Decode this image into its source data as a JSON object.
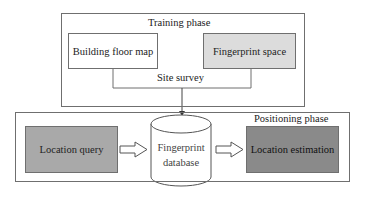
{
  "diagram": {
    "training_phase": {
      "title": "Training phase",
      "building_floor_map": "Building floor map",
      "fingerprint_space": "Fingerprint space",
      "connector_label": "Site survey"
    },
    "positioning_phase": {
      "title": "Positioning phase",
      "location_query": "Location query",
      "database_line1": "Fingerprint",
      "database_line2": "database",
      "location_estimation": "Location estimation"
    },
    "colors": {
      "frame_stroke": "#6f6f6f",
      "building_floor_map_fill": "#ffffff",
      "fingerprint_space_fill": "#dcdcdc",
      "location_query_fill": "#a9a9a9",
      "location_estimation_fill": "#8a8a8a",
      "database_fill": "#ffffff"
    }
  }
}
